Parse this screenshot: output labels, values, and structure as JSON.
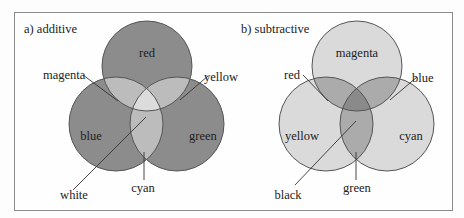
{
  "panels": {
    "additive": {
      "title": "a) additive",
      "circles": {
        "top": "red",
        "left": "blue",
        "right": "green"
      },
      "overlaps": {
        "top_left": "magenta",
        "top_right": "yellow",
        "bottom": "cyan",
        "center": "white"
      },
      "colors": {
        "circle": "#8c8c8c",
        "pair": "#bcbcbc",
        "center": "#dcdcdc",
        "stroke": "#555555"
      }
    },
    "subtractive": {
      "title": "b) subtractive",
      "circles": {
        "top": "magenta",
        "left": "yellow",
        "right": "cyan"
      },
      "overlaps": {
        "top_left": "red",
        "top_right": "blue",
        "bottom": "green",
        "center": "black"
      },
      "colors": {
        "circle": "#dadada",
        "pair": "#ababab",
        "center": "#8a8a8a",
        "stroke": "#555555"
      }
    }
  }
}
